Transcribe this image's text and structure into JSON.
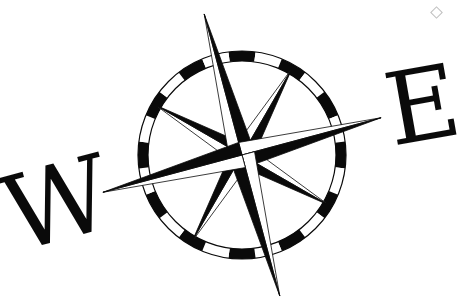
{
  "image": {
    "description": "Black and white nautical compass rose illustration",
    "letters": {
      "west": "W",
      "east": "E"
    },
    "compass": {
      "rotation_deg": -15,
      "ring_segments": 24,
      "principal_points": [
        "N",
        "E",
        "S",
        "W"
      ],
      "intercardinal_points": [
        "NE",
        "SE",
        "SW",
        "NW"
      ]
    },
    "colors": {
      "ink": "#0a0a0a",
      "paper": "#ffffff"
    }
  }
}
